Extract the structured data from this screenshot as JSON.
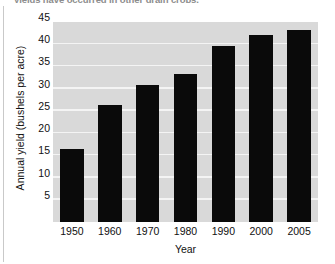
{
  "page": {
    "clipped_caption": "yields have occurred in other grain crops.",
    "rule_name": "page-margin-rule"
  },
  "colors": {
    "plot_background": "#d9d9d9",
    "gridline": "#f4f4f4",
    "bar": "#0a0a0a",
    "text": "#111111",
    "page_background": "#ffffff"
  },
  "chart_data": {
    "type": "bar",
    "title": "",
    "xlabel": "Year",
    "ylabel": "Annual yield (bushels per acre)",
    "categories": [
      "1950",
      "1960",
      "1970",
      "1980",
      "1990",
      "2000",
      "2005"
    ],
    "values": [
      16.4,
      26.4,
      30.8,
      33.4,
      39.5,
      42.1,
      43.1
    ],
    "ylim": [
      0,
      45
    ],
    "yticks": [
      5,
      10,
      15,
      20,
      25,
      30,
      35,
      40,
      45
    ],
    "ytick_labels": [
      "5",
      "10",
      "15",
      "20",
      "25",
      "30",
      "35",
      "40",
      "45"
    ],
    "grid": true,
    "grid_axis": "y",
    "legend": false,
    "legend_position": "none",
    "series": [
      {
        "name": "Annual yield",
        "values": [
          16.4,
          26.4,
          30.8,
          33.4,
          39.5,
          42.1,
          43.1
        ]
      }
    ]
  }
}
